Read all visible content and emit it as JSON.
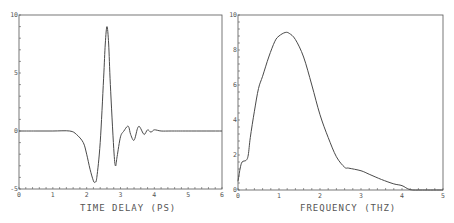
{
  "chart_data": [
    {
      "type": "line",
      "title": "",
      "xlabel": "TIME DELAY (PS)",
      "ylabel": "",
      "xlim": [
        0,
        6
      ],
      "ylim": [
        -5,
        10
      ],
      "xticks": [
        "0",
        "1",
        "2",
        "3",
        "4",
        "5",
        "6"
      ],
      "yticks": [
        "-5",
        "0",
        "5",
        "10"
      ],
      "grid": false,
      "series": [
        {
          "name": "waveform",
          "x": [
            0,
            0.5,
            1.0,
            1.5,
            1.7,
            1.9,
            2.0,
            2.1,
            2.2,
            2.25,
            2.3,
            2.4,
            2.5,
            2.55,
            2.6,
            2.65,
            2.7,
            2.8,
            2.85,
            2.9,
            3.0,
            3.1,
            3.2,
            3.25,
            3.3,
            3.4,
            3.5,
            3.55,
            3.6,
            3.7,
            3.8,
            3.9,
            4.0,
            4.2,
            4.5,
            5.0,
            6.0
          ],
          "y": [
            0,
            0,
            0,
            0,
            -0.3,
            -1.0,
            -2.0,
            -3.3,
            -4.3,
            -4.4,
            -4.0,
            -1.0,
            4.5,
            7.5,
            9.0,
            7.5,
            4.0,
            -1.5,
            -3.0,
            -2.2,
            -0.5,
            0.0,
            0.4,
            0.3,
            -0.3,
            -0.8,
            0.2,
            0.4,
            0.2,
            -0.3,
            0.1,
            -0.1,
            0.1,
            0,
            0,
            0,
            0
          ]
        }
      ]
    },
    {
      "type": "line",
      "title": "",
      "xlabel": "FREQUENCY (THZ)",
      "ylabel": "",
      "xlim": [
        0,
        5
      ],
      "ylim": [
        0,
        10
      ],
      "xticks": [
        "0",
        "1",
        "2",
        "3",
        "4",
        "5"
      ],
      "yticks": [
        "0",
        "2",
        "4",
        "6",
        "8",
        "10"
      ],
      "grid": false,
      "series": [
        {
          "name": "spectrum",
          "x": [
            0,
            0.05,
            0.1,
            0.2,
            0.25,
            0.3,
            0.4,
            0.5,
            0.6,
            0.75,
            0.9,
            1.0,
            1.15,
            1.25,
            1.4,
            1.6,
            1.8,
            2.0,
            2.2,
            2.4,
            2.6,
            2.7,
            3.0,
            3.2,
            3.5,
            3.8,
            4.0,
            4.2,
            4.5,
            5.0
          ],
          "y": [
            0.5,
            1.2,
            1.6,
            1.7,
            2.0,
            3.0,
            4.5,
            5.8,
            6.5,
            7.6,
            8.5,
            8.8,
            9.0,
            8.95,
            8.6,
            7.6,
            6.0,
            4.3,
            3.0,
            1.9,
            1.3,
            1.25,
            1.1,
            0.9,
            0.6,
            0.35,
            0.25,
            0.02,
            0.0,
            0.0
          ]
        }
      ]
    }
  ],
  "labels": {
    "left_xlabel": "TIME DELAY (PS)",
    "right_xlabel": "FREQUENCY (THZ)"
  },
  "colors": {
    "line": "#4a4a4a",
    "axis": "#555555",
    "text": "#555555"
  }
}
